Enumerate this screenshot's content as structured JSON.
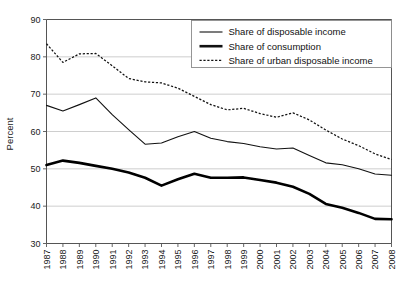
{
  "chart_data": {
    "type": "line",
    "title": "",
    "xlabel": "",
    "ylabel": "Percent",
    "ylim": [
      30,
      90
    ],
    "yticks": [
      30,
      40,
      50,
      60,
      70,
      80,
      90
    ],
    "grid": true,
    "legend_position": "top-right",
    "x": [
      1987,
      1988,
      1989,
      1990,
      1991,
      1992,
      1993,
      1994,
      1995,
      1996,
      1997,
      1998,
      1999,
      2000,
      2001,
      2002,
      2003,
      2004,
      2005,
      2006,
      2007,
      2008
    ],
    "categories": [
      "1987",
      "1988",
      "1989",
      "1990",
      "1991",
      "1992",
      "1993",
      "1994",
      "1995",
      "1996",
      "1997",
      "1998",
      "1999",
      "2000",
      "2001",
      "2002",
      "2003",
      "2004",
      "2005",
      "2006",
      "2007",
      "2008"
    ],
    "series": [
      {
        "name": "Share of disposable income",
        "style": "thin-solid",
        "values": [
          67.0,
          65.5,
          67.2,
          69.0,
          64.5,
          60.5,
          56.6,
          56.9,
          58.6,
          60.0,
          58.2,
          57.3,
          56.8,
          55.9,
          55.3,
          55.6,
          53.6,
          51.6,
          51.1,
          50.0,
          48.6,
          48.3
        ]
      },
      {
        "name": "Share of consumption",
        "style": "thick-solid",
        "values": [
          51.0,
          52.2,
          51.6,
          50.8,
          50.0,
          49.0,
          47.6,
          45.5,
          47.2,
          48.7,
          47.6,
          47.6,
          47.7,
          47.0,
          46.3,
          45.2,
          43.3,
          40.6,
          39.6,
          38.2,
          36.6,
          36.5
        ]
      },
      {
        "name": "Share of urban disposable income",
        "style": "dotted",
        "values": [
          83.5,
          78.5,
          80.8,
          80.9,
          77.6,
          74.2,
          73.3,
          73.0,
          71.6,
          69.4,
          67.2,
          65.8,
          66.2,
          64.8,
          63.8,
          65.0,
          63.1,
          60.4,
          58.0,
          56.2,
          54.0,
          52.5
        ]
      }
    ],
    "legend_entries": [
      {
        "label": "Share of disposable income",
        "style": "thin-solid"
      },
      {
        "label": "Share of consumption",
        "style": "thick-solid"
      },
      {
        "label": "Share of urban disposable income",
        "style": "dotted"
      }
    ]
  }
}
